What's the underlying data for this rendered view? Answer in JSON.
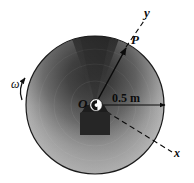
{
  "figure": {
    "kind": "engineering-diagram",
    "colors": {
      "ink": "#0b0b0b",
      "background": "#ffffff",
      "disk_dark": "#2b2b2b",
      "disk_mid": "#8c8c8c",
      "disk_light": "#e3e3e3",
      "hub_fill": "#fdfdfd",
      "base_fill": "#262626"
    },
    "labels": {
      "axis_y": "y",
      "axis_x": "x",
      "point_p": "P",
      "center_o": "O",
      "angular_velocity": "ω",
      "dimension": "0.5 m"
    },
    "geometry": {
      "center": {
        "x": 95,
        "y": 105
      },
      "radius_px": 69,
      "radius_value": "0.5 m",
      "point_p": {
        "x": 126,
        "y": 47
      },
      "axis_y_tip": {
        "x": 146,
        "y": 16
      },
      "axis_x_tip": {
        "x": 172,
        "y": 152
      }
    }
  }
}
